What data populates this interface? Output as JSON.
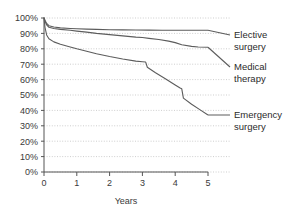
{
  "chart_data": {
    "type": "line",
    "title": "",
    "subtitle": "",
    "xlabel": "Years",
    "ylabel": "",
    "xlim": [
      0,
      5
    ],
    "ylim": [
      0,
      100
    ],
    "grid": true,
    "legend_position": "right",
    "x_ticks": [
      "0",
      "1",
      "2",
      "3",
      "4",
      "5"
    ],
    "x_tick_values": [
      0,
      1,
      2,
      3,
      4,
      5
    ],
    "y_ticks": [
      "0%",
      "10%",
      "20%",
      "30%",
      "40%",
      "50%",
      "60%",
      "70%",
      "80%",
      "90%",
      "100%"
    ],
    "y_tick_values": [
      0,
      10,
      20,
      30,
      40,
      50,
      60,
      70,
      80,
      90,
      100
    ],
    "series": [
      {
        "name": "Elective surgery",
        "label_line1": "Elective",
        "label_line2": "surgery",
        "end_value": 92,
        "x": [
          0.0,
          0.03,
          0.08,
          0.15,
          0.3,
          0.5,
          0.8,
          1.0,
          1.3,
          1.6,
          2.0,
          2.4,
          2.8,
          3.2,
          3.6,
          4.0,
          4.4,
          4.7,
          5.0
        ],
        "values": [
          100,
          98.5,
          96.5,
          95.0,
          94.2,
          93.6,
          93.2,
          93.0,
          92.8,
          92.6,
          92.4,
          92.3,
          92.2,
          92.1,
          92.0,
          92.0,
          92.0,
          92.0,
          92.0
        ]
      },
      {
        "name": "Medical therapy",
        "label_line1": "Medical",
        "label_line2": "therapy",
        "end_value": 81,
        "x": [
          0.0,
          0.03,
          0.08,
          0.15,
          0.3,
          0.5,
          0.8,
          1.0,
          1.3,
          1.6,
          2.0,
          2.4,
          2.8,
          3.0,
          3.2,
          3.5,
          3.8,
          4.0,
          4.2,
          4.5,
          4.7,
          5.0
        ],
        "values": [
          100,
          98.0,
          95.5,
          94.0,
          93.2,
          92.6,
          92.0,
          91.5,
          90.8,
          90.0,
          89.2,
          88.4,
          87.6,
          87.3,
          86.8,
          86.0,
          85.0,
          84.0,
          82.6,
          81.6,
          81.2,
          81.0
        ]
      },
      {
        "name": "Emergency surgery",
        "label_line1": "Emergency",
        "label_line2": "surgery",
        "end_value": 37,
        "x": [
          0.0,
          0.03,
          0.08,
          0.15,
          0.3,
          0.5,
          0.8,
          1.0,
          1.3,
          1.6,
          2.0,
          2.4,
          2.8,
          3.0,
          3.1,
          3.15,
          3.4,
          3.7,
          4.0,
          4.15,
          4.2,
          4.25,
          4.5,
          4.75,
          5.0
        ],
        "values": [
          100,
          94.0,
          89.0,
          86.5,
          84.5,
          83.0,
          81.2,
          80.0,
          78.4,
          76.8,
          75.0,
          73.4,
          72.0,
          71.6,
          71.4,
          68.0,
          64.4,
          60.6,
          56.5,
          54.5,
          54.0,
          48.0,
          44.0,
          40.5,
          37.0
        ]
      }
    ]
  },
  "axis": {
    "x_title": "Years"
  }
}
